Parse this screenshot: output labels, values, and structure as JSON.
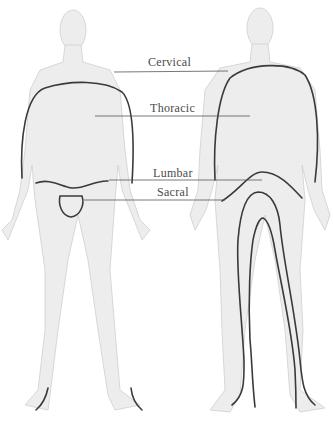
{
  "diagram": {
    "type": "dermatome-body-map",
    "views": [
      "front",
      "back"
    ],
    "labels": [
      {
        "id": "cervical",
        "text": "Cervical",
        "x": 148,
        "y": 57
      },
      {
        "id": "thoracic",
        "text": "Thoracic",
        "x": 150,
        "y": 103
      },
      {
        "id": "lumbar",
        "text": "Lumbar",
        "x": 153,
        "y": 171
      },
      {
        "id": "sacral",
        "text": "Sacral",
        "x": 157,
        "y": 190
      }
    ],
    "colors": {
      "background": "#ffffff",
      "body_shading": "#ededed",
      "outline": "#3a3a3a",
      "label_text": "#4a4a4a"
    }
  }
}
